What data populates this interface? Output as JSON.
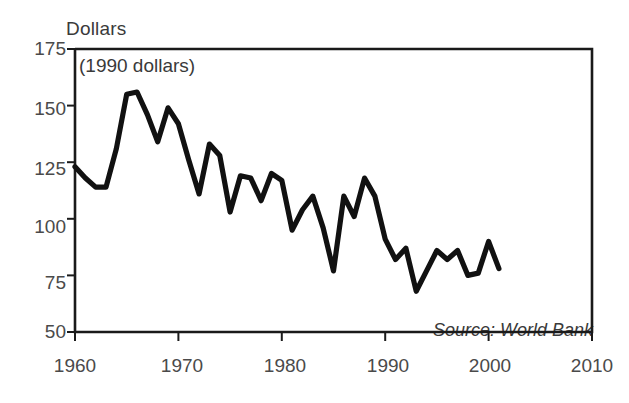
{
  "chart_data": {
    "type": "line",
    "title": "",
    "ylabel": "Dollars",
    "xlabel": "",
    "annotation_units": "(1990 dollars)",
    "source": "Source: World Bank",
    "grid": false,
    "legend": "none",
    "xlim": [
      1960,
      2010
    ],
    "ylim": [
      50,
      175
    ],
    "xticks": [
      1960,
      1970,
      1980,
      1990,
      2000,
      2010
    ],
    "xtick_labels": [
      "1960",
      "1970",
      "1980",
      "1990",
      "2000",
      "2010"
    ],
    "yticks": [
      50,
      75,
      100,
      125,
      150,
      175
    ],
    "ytick_labels": [
      "50",
      "75",
      "100",
      "125",
      "150",
      "175"
    ],
    "line_color": "#111111",
    "axis_color": "#1a1a1a",
    "x": [
      1960,
      1961,
      1962,
      1963,
      1964,
      1965,
      1966,
      1967,
      1968,
      1969,
      1970,
      1971,
      1972,
      1973,
      1974,
      1975,
      1976,
      1977,
      1978,
      1979,
      1980,
      1981,
      1982,
      1983,
      1984,
      1985,
      1986,
      1987,
      1988,
      1989,
      1990,
      1991,
      1992,
      1993,
      1994,
      1995,
      1996,
      1997,
      1998,
      1999,
      2000,
      2001
    ],
    "values": [
      123,
      118,
      114,
      114,
      131,
      155,
      156,
      146,
      134,
      149,
      142,
      126,
      111,
      133,
      128,
      103,
      119,
      118,
      108,
      120,
      117,
      95,
      104,
      110,
      96,
      77,
      110,
      101,
      118,
      110,
      91,
      82,
      87,
      68,
      77,
      86,
      82,
      86,
      75,
      76,
      90,
      78
    ],
    "ytick_pixels": {
      "50": 332,
      "75": 283,
      "100": 227,
      "125": 169,
      "150": 109,
      "175": 49
    },
    "xtick_pixels": {
      "1960": 75,
      "1970": 182,
      "1980": 285,
      "1990": 388,
      "2000": 490,
      "2010": 592
    }
  },
  "axis": {
    "y_title": "Dollars",
    "units_note": "(1990 dollars)",
    "source_text": "Source: World Bank"
  }
}
